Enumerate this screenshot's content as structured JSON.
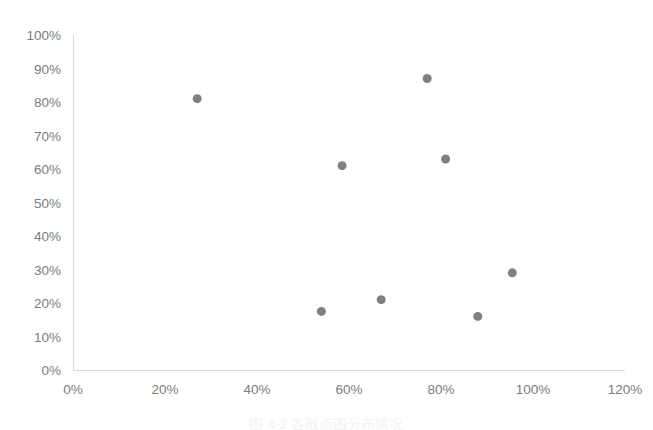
{
  "chart_data": {
    "type": "scatter",
    "title": "",
    "subtitle": "",
    "xlabel": "",
    "ylabel": "",
    "xlim": [
      0,
      120
    ],
    "ylim": [
      0,
      100
    ],
    "grid": false,
    "legend": "none",
    "x_tick_labels": [
      "0%",
      "20%",
      "40%",
      "60%",
      "80%",
      "100%",
      "120%"
    ],
    "x_tick_values": [
      0,
      20,
      40,
      60,
      80,
      100,
      120
    ],
    "y_tick_labels": [
      "0%",
      "10%",
      "20%",
      "30%",
      "40%",
      "50%",
      "60%",
      "70%",
      "80%",
      "90%",
      "100%"
    ],
    "y_tick_values": [
      0,
      10,
      20,
      30,
      40,
      50,
      60,
      70,
      80,
      90,
      100
    ],
    "marker_color": "#808080",
    "marker_size": 9,
    "series": [
      {
        "name": "series-1",
        "points": [
          {
            "x": 27,
            "y": 81
          },
          {
            "x": 54,
            "y": 17.5
          },
          {
            "x": 58.5,
            "y": 61
          },
          {
            "x": 67,
            "y": 21
          },
          {
            "x": 77,
            "y": 87
          },
          {
            "x": 81,
            "y": 63
          },
          {
            "x": 88,
            "y": 16
          },
          {
            "x": 95.5,
            "y": 29
          }
        ]
      }
    ]
  },
  "caption": {
    "text": "图 4-2 各散点图分布情况"
  }
}
